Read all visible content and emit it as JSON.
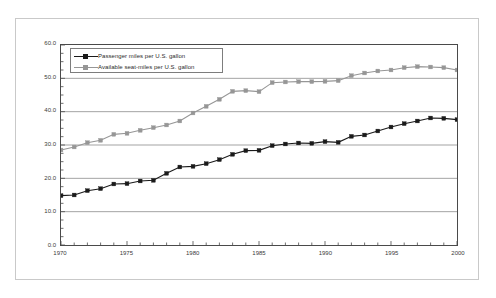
{
  "chart_data": {
    "type": "line",
    "title": "",
    "xlabel": "",
    "ylabel": "Miles per U.S. gallon",
    "xlim": [
      1970,
      2000
    ],
    "ylim": [
      0.0,
      60.0
    ],
    "grid": true,
    "grid_axis": "y",
    "legend_position": "top-left inside plot",
    "x_tick_labels": [
      "1970",
      "1975",
      "1980",
      "1985",
      "1990",
      "1995",
      "2000"
    ],
    "x_major_ticks": [
      1970,
      1975,
      1980,
      1985,
      1990,
      1995,
      2000
    ],
    "x_minor_tick_interval": 1,
    "y_tick_labels": [
      "0.0",
      "10.0",
      "20.0",
      "30.0",
      "40.0",
      "50.0",
      "60.0"
    ],
    "y_major_ticks": [
      0.0,
      10.0,
      20.0,
      30.0,
      40.0,
      50.0,
      60.0
    ],
    "y_minor_tick_interval": 2.5,
    "marker": "square",
    "x": [
      1970,
      1971,
      1972,
      1973,
      1974,
      1975,
      1976,
      1977,
      1978,
      1979,
      1980,
      1981,
      1982,
      1983,
      1984,
      1985,
      1986,
      1987,
      1988,
      1989,
      1990,
      1991,
      1992,
      1993,
      1994,
      1995,
      1996,
      1997,
      1998,
      1999,
      2000
    ],
    "series": [
      {
        "name": "Passenger miles per U.S. gallon",
        "color": "#1a1a1a",
        "values": [
          14.8,
          15.0,
          16.3,
          16.9,
          18.3,
          18.4,
          19.2,
          19.4,
          21.5,
          23.4,
          23.6,
          24.4,
          25.6,
          27.2,
          28.3,
          28.4,
          29.8,
          30.3,
          30.6,
          30.5,
          31.0,
          30.8,
          32.6,
          33.0,
          34.2,
          35.4,
          36.4,
          37.2,
          38.1,
          38.0,
          37.6
        ]
      },
      {
        "name": "Available seat-miles per U.S. gallon",
        "color": "#969696",
        "values": [
          28.5,
          29.4,
          30.7,
          31.4,
          33.2,
          33.5,
          34.4,
          35.2,
          36.0,
          37.2,
          39.6,
          41.6,
          43.7,
          46.1,
          46.3,
          46.0,
          48.7,
          48.9,
          49.0,
          49.0,
          49.1,
          49.3,
          50.8,
          51.6,
          52.2,
          52.5,
          53.2,
          53.5,
          53.4,
          53.2,
          52.5
        ]
      }
    ]
  },
  "legend": {
    "items": [
      {
        "label": "Passenger miles per U.S. gallon",
        "color": "#1a1a1a"
      },
      {
        "label": "Available seat-miles per U.S. gallon",
        "color": "#969696"
      }
    ]
  }
}
